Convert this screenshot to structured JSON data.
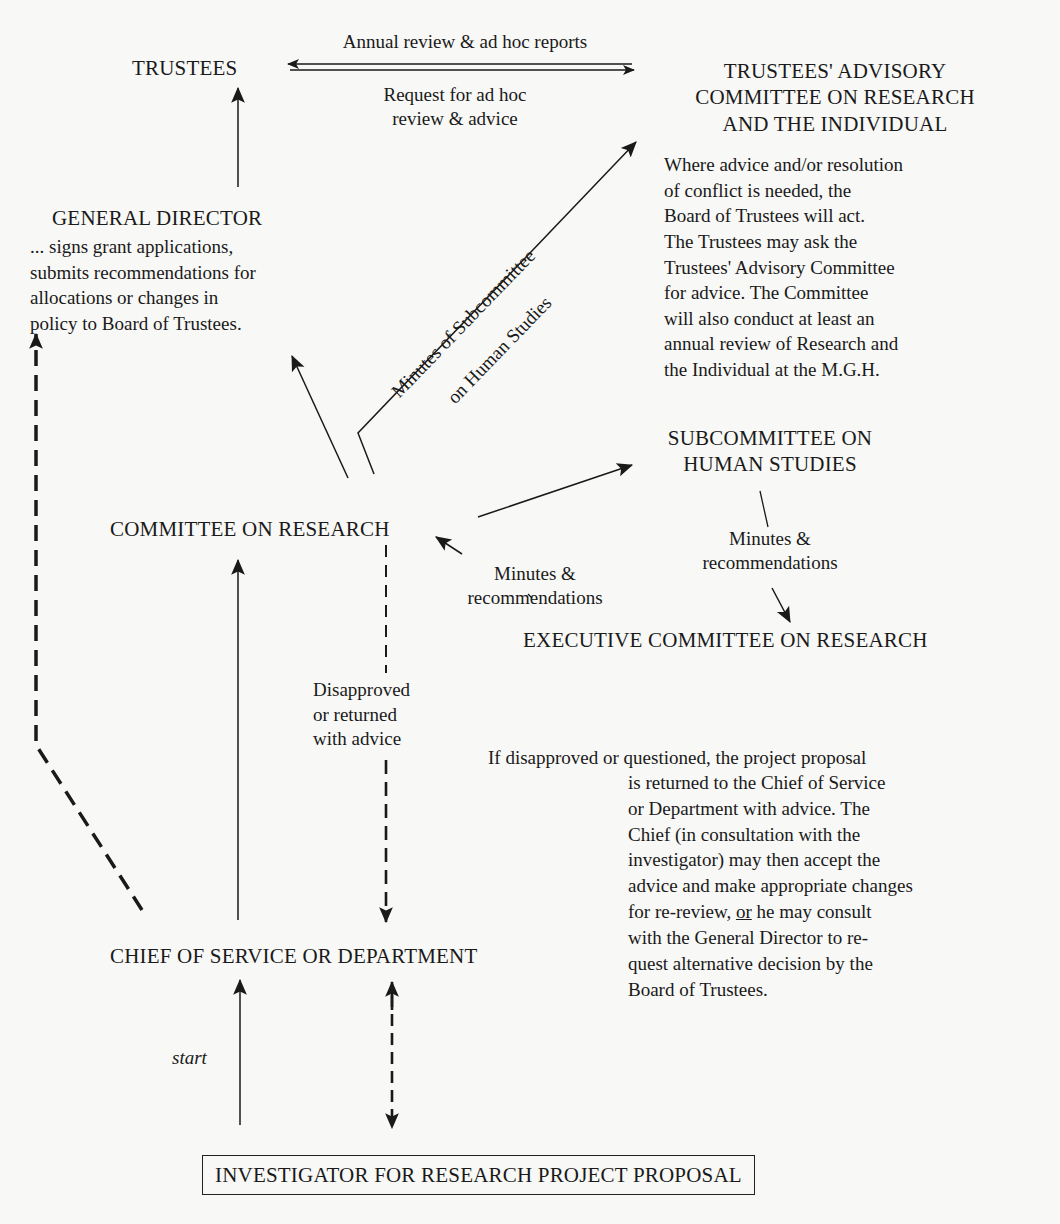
{
  "diagram": {
    "type": "organizational flowchart",
    "nodes": {
      "trustees": "TRUSTEES",
      "advisory_committee": [
        "TRUSTEES' ADVISORY",
        "COMMITTEE ON RESEARCH",
        "AND THE INDIVIDUAL"
      ],
      "general_director": "GENERAL DIRECTOR",
      "committee_on_research": "COMMITTEE ON RESEARCH",
      "subcommittee_human_studies": [
        "SUBCOMMITTEE ON",
        "HUMAN STUDIES"
      ],
      "executive_committee": "EXECUTIVE COMMITTEE ON RESEARCH",
      "chief_of_service": "CHIEF OF SERVICE OR DEPARTMENT",
      "investigator": "INVESTIGATOR FOR RESEARCH PROJECT PROPOSAL"
    },
    "edge_labels": {
      "annual_review": "Annual review & ad hoc reports",
      "request_review": [
        "Request for ad hoc",
        "review & advice"
      ],
      "minutes_subcommittee": [
        "Minutes of Subcommittee",
        "on Human Studies"
      ],
      "minutes_recs_left": [
        "Minutes &",
        "recommendations"
      ],
      "minutes_recs_right": [
        "Minutes &",
        "recommendations"
      ],
      "disapproved": [
        "Disapproved",
        "or returned",
        "with advice"
      ],
      "start": "start"
    },
    "descriptions": {
      "general_director": "... signs grant applications,\nsubmits recommendations for\nallocations or changes in\npolicy to Board of Trustees.",
      "advisory_committee": "Where advice and/or resolution\nof conflict is needed, the\nBoard of Trustees will act.\nThe Trustees may ask the\nTrustees' Advisory Committee\nfor advice. The Committee\nwill also conduct at least an\nannual review of Research and\nthe Individual at the M.G.H.",
      "disapproval_first_line": "If disapproved or questioned, the project proposal",
      "disapproval_rest_1": "is returned to the Chief of Service\nor Department with advice. The\nChief (in consultation with the\ninvestigator) may then accept the\nadvice and make appropriate changes\nfor re-review, ",
      "disapproval_or": "or",
      "disapproval_rest_2": " he may consult\nwith the General Director to re-\nquest alternative decision by the\nBoard of Trustees."
    },
    "edges": [
      {
        "from": "advisory_committee",
        "to": "trustees",
        "label": "Annual review & ad hoc reports",
        "style": "solid"
      },
      {
        "from": "trustees",
        "to": "advisory_committee",
        "label": "Request for ad hoc review & advice",
        "style": "solid"
      },
      {
        "from": "general_director",
        "to": "trustees",
        "style": "solid"
      },
      {
        "from": "committee_on_research",
        "to": "general_director",
        "style": "solid"
      },
      {
        "from": "committee_on_research",
        "to": "advisory_committee",
        "label": "Minutes of Subcommittee on Human Studies",
        "style": "solid"
      },
      {
        "from": "committee_on_research",
        "to": "subcommittee_human_studies",
        "style": "solid"
      },
      {
        "from": "executive_committee",
        "to": "committee_on_research",
        "label": "Minutes & recommendations",
        "style": "solid"
      },
      {
        "from": "subcommittee_human_studies",
        "to": "executive_committee",
        "label": "Minutes & recommendations",
        "style": "solid"
      },
      {
        "from": "chief_of_service",
        "to": "committee_on_research",
        "style": "solid"
      },
      {
        "from": "committee_on_research",
        "to": "chief_of_service",
        "label": "Disapproved or returned with advice",
        "style": "dashed"
      },
      {
        "from": "chief_of_service",
        "to": "general_director",
        "style": "dashed"
      },
      {
        "from": "investigator",
        "to": "chief_of_service",
        "label": "start",
        "style": "solid"
      },
      {
        "from": "chief_of_service",
        "to": "investigator",
        "style": "dashed-bidirectional"
      }
    ],
    "colors": {
      "ink": "#1a1a1a",
      "paper": "#f8f8f6"
    }
  }
}
